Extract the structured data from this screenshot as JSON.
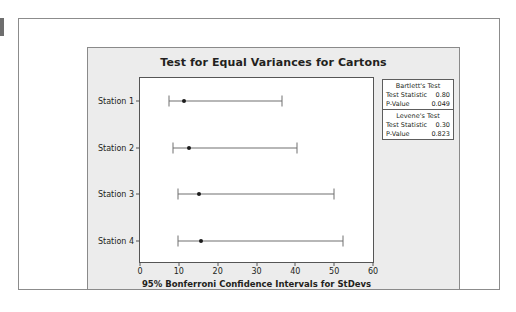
{
  "chart_data": {
    "type": "scatter",
    "title": "Test for Equal Variances for Cartons",
    "xlabel": "95% Bonferroni Confidence Intervals for StDevs",
    "ylabel": "",
    "xlim": [
      0,
      60
    ],
    "xticks": [
      0,
      10,
      20,
      30,
      40,
      50,
      60
    ],
    "grid": false,
    "categories": [
      "Station 1",
      "Station 2",
      "Station 3",
      "Station 4"
    ],
    "intervals": [
      {
        "category": "Station 1",
        "lower": 7.5,
        "point": 11.3,
        "upper": 36.5
      },
      {
        "category": "Station 2",
        "lower": 8.5,
        "point": 12.6,
        "upper": 40.4
      },
      {
        "category": "Station 3",
        "lower": 9.8,
        "point": 15.2,
        "upper": 50.0
      },
      {
        "category": "Station 4",
        "lower": 9.8,
        "point": 15.7,
        "upper": 52.3
      }
    ]
  },
  "stats_box": {
    "sections": [
      {
        "heading": "Bartlett's Test",
        "rows": [
          {
            "label": "Test Statistic",
            "value": "0.80"
          },
          {
            "label": "P-Value",
            "value": "0.049"
          }
        ]
      },
      {
        "heading": "Levene's Test",
        "rows": [
          {
            "label": "Test Statistic",
            "value": "0.30"
          },
          {
            "label": "P-Value",
            "value": "0.823"
          }
        ]
      }
    ]
  },
  "colors": {
    "panel_background": "#ececec",
    "plot_background": "#ffffff",
    "axis": "#555555",
    "interval": "#707070",
    "point": "#1c1c1c",
    "text": "#231f20"
  }
}
